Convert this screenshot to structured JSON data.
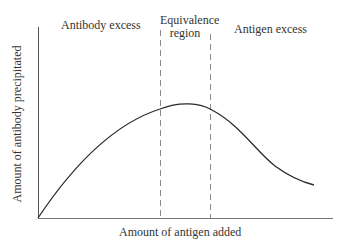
{
  "diagram": {
    "regions": [
      {
        "label": "Antibody excess"
      },
      {
        "label_line1": "Equivalence",
        "label_line2": "region"
      },
      {
        "label": "Antigen excess"
      }
    ],
    "x_axis_label": "Amount of antigen added",
    "y_axis_label": "Amount of antibody precipitated",
    "colors": {
      "line": "#2b2b2b",
      "dashed": "#8a8a8a",
      "axis": "#555555"
    }
  }
}
